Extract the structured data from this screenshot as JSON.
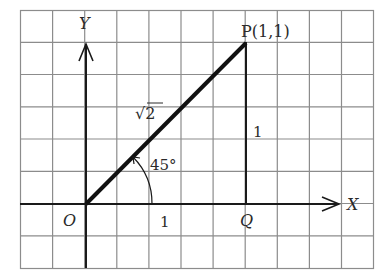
{
  "diagram": {
    "type": "coordinate-grid",
    "grid": {
      "columns": 11,
      "rows": 8,
      "line_color": "#8c8c8c"
    },
    "axes": {
      "x_label": "X",
      "y_label": "Y",
      "origin_label": "O"
    },
    "points": {
      "P": {
        "label": "P(1,1)",
        "x": 1,
        "y": 1
      },
      "Q": {
        "label": "Q",
        "x": 1,
        "y": 0
      }
    },
    "segments": {
      "OP_length_label": "√2",
      "OQ_length_label": "1",
      "PQ_length_label": "1"
    },
    "angle": {
      "label": "45°"
    },
    "colors": {
      "line": "#1a1a1a",
      "text": "#2a2a2a",
      "grid": "#8c8c8c"
    }
  }
}
